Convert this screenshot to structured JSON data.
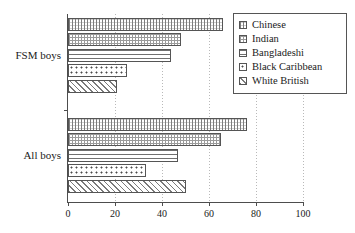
{
  "chart_data": {
    "type": "bar",
    "orientation": "horizontal",
    "title": "",
    "xlabel": "",
    "ylabel": "",
    "categories": [
      "FSM boys",
      "All boys"
    ],
    "series": [
      {
        "name": "Chinese",
        "values": [
          66,
          76
        ],
        "pattern": "cross-hatch-fine"
      },
      {
        "name": "Indian",
        "values": [
          48,
          65
        ],
        "pattern": "grid-dots"
      },
      {
        "name": "Bangladeshi",
        "values": [
          44,
          47
        ],
        "pattern": "horizontal-lines"
      },
      {
        "name": "Black Caribbean",
        "values": [
          25,
          33
        ],
        "pattern": "dots"
      },
      {
        "name": "White British",
        "values": [
          21,
          50
        ],
        "pattern": "diagonal-lines"
      }
    ],
    "xlim": [
      0,
      100
    ],
    "xticks": [
      0,
      20,
      40,
      60,
      80,
      100
    ],
    "xtick_labels": [
      "0",
      "20",
      "40",
      "60",
      "80",
      "100"
    ],
    "grid": true,
    "grid_axis": "x",
    "legend_position": "top-right",
    "colors": {
      "axis": "#4d4d4d",
      "grid": "#b9b9b9",
      "bar_outline": "#555555",
      "background": "#ffffff",
      "text": "#1a1a1a"
    }
  },
  "legend": {
    "items": [
      {
        "label": "Chinese"
      },
      {
        "label": "Indian"
      },
      {
        "label": "Bangladeshi"
      },
      {
        "label": "Black Caribbean"
      },
      {
        "label": "White British"
      }
    ]
  }
}
